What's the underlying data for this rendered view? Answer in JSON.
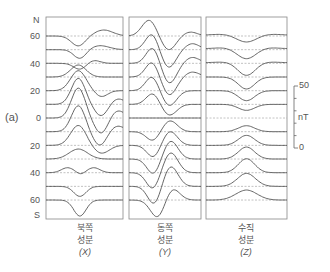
{
  "figure": {
    "panel_label": "(a)",
    "lat_labels": [
      "N",
      "60",
      "40",
      "20",
      "0",
      "20",
      "40",
      "60",
      "S"
    ],
    "scale": {
      "top": "50",
      "unit": "nT",
      "bottom": "0"
    },
    "panels": [
      {
        "id": "X",
        "line1": "북쪽",
        "line2": "성분",
        "line3": "(X)"
      },
      {
        "id": "Y",
        "line1": "동쪽",
        "line2": "성분",
        "line3": "(Y)"
      },
      {
        "id": "Z",
        "line1": "수직",
        "line2": "성분",
        "line3": "(Z)"
      }
    ],
    "colors": {
      "curve": "#555555",
      "baseline": "#999999",
      "frame": "#888888"
    }
  },
  "chart_data": {
    "type": "line",
    "title": "",
    "xlabel": "local time",
    "ylabel": "latitude",
    "scale_bar": {
      "min": 0,
      "max": 50,
      "unit": "nT"
    },
    "latitudes": [
      60,
      50,
      40,
      30,
      20,
      10,
      0,
      -10,
      -20,
      -30,
      -40,
      -50,
      -60
    ],
    "series": [
      {
        "name": "북쪽 성분 (X)",
        "rows": [
          [
            [
              -10,
              0.42,
              0.09
            ],
            [
              6,
              0.75,
              0.12
            ]
          ],
          [
            [
              -9,
              0.44,
              0.08
            ],
            [
              4,
              0.7,
              0.12
            ]
          ],
          [
            [
              -6,
              0.44,
              0.08
            ],
            [
              3,
              0.62,
              0.08
            ]
          ],
          [
            [
              12,
              0.42,
              0.1
            ]
          ],
          [
            [
              20,
              0.42,
              0.1
            ],
            [
              -6,
              0.72,
              0.08
            ]
          ],
          [
            [
              26,
              0.42,
              0.09
            ],
            [
              -12,
              0.72,
              0.09
            ],
            [
              6,
              0.92,
              0.1
            ]
          ],
          [
            [
              30,
              0.42,
              0.09
            ],
            [
              -16,
              0.72,
              0.09
            ],
            [
              8,
              0.92,
              0.1
            ]
          ],
          [
            [
              26,
              0.42,
              0.09
            ],
            [
              -14,
              0.7,
              0.09
            ],
            [
              6,
              0.92,
              0.1
            ]
          ],
          [
            [
              20,
              0.42,
              0.1
            ],
            [
              -8,
              0.72,
              0.1
            ]
          ],
          [
            [
              10,
              0.42,
              0.12
            ]
          ],
          [
            [
              5,
              0.28,
              0.08
            ],
            [
              5,
              0.62,
              0.08
            ],
            [
              -2,
              0.45,
              0.05
            ]
          ],
          [
            [
              -10,
              0.44,
              0.08
            ]
          ],
          [
            [
              -16,
              0.44,
              0.08
            ]
          ]
        ]
      },
      {
        "name": "동쪽 성분 (Y)",
        "rows": [
          [
            [
              16,
              0.28,
              0.1
            ],
            [
              -14,
              0.55,
              0.1
            ],
            [
              4,
              0.85,
              0.1
            ]
          ],
          [
            [
              16,
              0.32,
              0.09
            ],
            [
              -18,
              0.55,
              0.1
            ],
            [
              6,
              0.88,
              0.1
            ]
          ],
          [
            [
              16,
              0.33,
              0.09
            ],
            [
              -20,
              0.56,
              0.1
            ],
            [
              6,
              0.88,
              0.1
            ]
          ],
          [
            [
              15,
              0.32,
              0.09
            ],
            [
              -18,
              0.56,
              0.1
            ],
            [
              5,
              0.88,
              0.1
            ]
          ],
          [
            [
              14,
              0.32,
              0.09
            ],
            [
              -15,
              0.56,
              0.1
            ]
          ],
          [
            [
              11,
              0.33,
              0.09
            ],
            [
              -11,
              0.56,
              0.1
            ]
          ],
          [
            [
              0,
              0.5,
              0.1
            ]
          ],
          [
            [
              -9,
              0.33,
              0.09
            ],
            [
              11,
              0.57,
              0.1
            ]
          ],
          [
            [
              -12,
              0.34,
              0.09
            ],
            [
              14,
              0.57,
              0.1
            ]
          ],
          [
            [
              -15,
              0.34,
              0.09
            ],
            [
              18,
              0.58,
              0.1
            ]
          ],
          [
            [
              -16,
              0.33,
              0.09
            ],
            [
              20,
              0.58,
              0.1
            ]
          ],
          [
            [
              -18,
              0.35,
              0.09
            ],
            [
              20,
              0.58,
              0.1
            ]
          ],
          [
            [
              -18,
              0.4,
              0.1
            ],
            [
              12,
              0.6,
              0.1
            ]
          ]
        ]
      },
      {
        "name": "수직 성분 (Z)",
        "rows": [
          [
            [
              -9,
              0.5,
              0.13
            ],
            [
              3,
              0.5,
              0.35
            ]
          ],
          [
            [
              -12,
              0.5,
              0.12
            ],
            [
              3,
              0.5,
              0.35
            ]
          ],
          [
            [
              -14,
              0.5,
              0.11
            ],
            [
              2,
              0.5,
              0.35
            ]
          ],
          [
            [
              -12,
              0.5,
              0.1
            ]
          ],
          [
            [
              -10,
              0.5,
              0.1
            ]
          ],
          [
            [
              -6,
              0.5,
              0.1
            ]
          ],
          [],
          [
            [
              6,
              0.5,
              0.1
            ]
          ],
          [
            [
              10,
              0.5,
              0.1
            ]
          ],
          [
            [
              12,
              0.5,
              0.1
            ]
          ],
          [
            [
              14,
              0.5,
              0.1
            ]
          ],
          [
            [
              13,
              0.5,
              0.11
            ]
          ],
          [
            [
              10,
              0.5,
              0.13
            ]
          ]
        ]
      }
    ],
    "row_format": "each row = list of [amplitude_px(+up), center(0..1 of panel width), width]"
  }
}
